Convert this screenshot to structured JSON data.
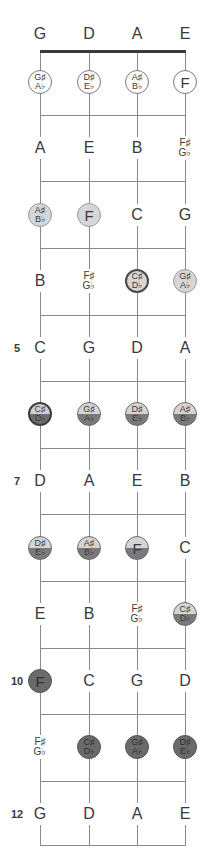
{
  "diagram": {
    "title_clipped": "",
    "strings": [
      "G",
      "D",
      "A",
      "E"
    ],
    "string_x": [
      40,
      89,
      137,
      185
    ],
    "nut_y": 51,
    "open_label_y": 34,
    "fret_lines_y": [
      115,
      181,
      248,
      315,
      381,
      448,
      514,
      581,
      648,
      714,
      781,
      845
    ],
    "fret_markers": [
      {
        "fret": 5,
        "label": "5"
      },
      {
        "fret": 7,
        "label": "7"
      },
      {
        "fret": 10,
        "label": "10"
      },
      {
        "fret": 12,
        "label": "12"
      }
    ],
    "colors": {
      "line": "#8a8a8a",
      "nut": "#3a3a3a",
      "light_fill": "#d6d6d6",
      "dark_fill": "#6a6a6a",
      "text": "#3a3a3a"
    },
    "frets": [
      {
        "fret": 1,
        "y": 82,
        "notes": [
          {
            "top": "G♯",
            "bottom": "A♭",
            "style": "outline"
          },
          {
            "top": "D♯",
            "bottom": "E♭",
            "style": "outline"
          },
          {
            "top": "A♯",
            "bottom": "B♭",
            "style": "outline"
          },
          {
            "text": "F",
            "style": "outline"
          }
        ]
      },
      {
        "fret": 2,
        "y": 148,
        "notes": [
          {
            "text": "A",
            "style": "plain"
          },
          {
            "text": "E",
            "style": "plain"
          },
          {
            "text": "B",
            "style": "plain"
          },
          {
            "top": "F♯",
            "bottom": "G♭",
            "style": "plain"
          }
        ]
      },
      {
        "fret": 3,
        "y": 215,
        "notes": [
          {
            "top": "A♯",
            "bottom": "B♭",
            "style": "light"
          },
          {
            "text": "F",
            "style": "light"
          },
          {
            "text": "C",
            "style": "plain"
          },
          {
            "text": "G",
            "style": "plain"
          }
        ]
      },
      {
        "fret": 4,
        "y": 281,
        "notes": [
          {
            "text": "B",
            "style": "plain"
          },
          {
            "top": "F♯",
            "bottom": "G♭",
            "style": "plain"
          },
          {
            "top": "C♯",
            "bottom": "D♭",
            "style": "ring"
          },
          {
            "top": "G♯",
            "bottom": "A♭",
            "style": "light"
          }
        ]
      },
      {
        "fret": 5,
        "y": 348,
        "notes": [
          {
            "text": "C",
            "style": "plain"
          },
          {
            "text": "G",
            "style": "plain"
          },
          {
            "text": "D",
            "style": "plain"
          },
          {
            "text": "A",
            "style": "plain"
          }
        ]
      },
      {
        "fret": 6,
        "y": 414,
        "notes": [
          {
            "top": "C♯",
            "bottom": "D♭",
            "style": "split-ring"
          },
          {
            "top": "G♯",
            "bottom": "A♭",
            "style": "split"
          },
          {
            "top": "D♯",
            "bottom": "E♭",
            "style": "split"
          },
          {
            "top": "A♯",
            "bottom": "B♭",
            "style": "split"
          }
        ]
      },
      {
        "fret": 7,
        "y": 481,
        "notes": [
          {
            "text": "D",
            "style": "plain"
          },
          {
            "text": "A",
            "style": "plain"
          },
          {
            "text": "E",
            "style": "plain"
          },
          {
            "text": "B",
            "style": "plain"
          }
        ]
      },
      {
        "fret": 8,
        "y": 548,
        "notes": [
          {
            "top": "D♯",
            "bottom": "E♭",
            "style": "split"
          },
          {
            "top": "A♯",
            "bottom": "B♭",
            "style": "split"
          },
          {
            "text": "F",
            "style": "split"
          },
          {
            "text": "C",
            "style": "plain"
          }
        ]
      },
      {
        "fret": 9,
        "y": 614,
        "notes": [
          {
            "text": "E",
            "style": "plain"
          },
          {
            "text": "B",
            "style": "plain"
          },
          {
            "top": "F♯",
            "bottom": "G♭",
            "style": "plain"
          },
          {
            "top": "C♯",
            "bottom": "D♭",
            "style": "split"
          }
        ]
      },
      {
        "fret": 10,
        "y": 681,
        "notes": [
          {
            "text": "F",
            "style": "dark"
          },
          {
            "text": "C",
            "style": "plain"
          },
          {
            "text": "G",
            "style": "plain"
          },
          {
            "text": "D",
            "style": "plain"
          }
        ]
      },
      {
        "fret": 11,
        "y": 747,
        "notes": [
          {
            "top": "F♯",
            "bottom": "G♭",
            "style": "plain"
          },
          {
            "top": "C♯",
            "bottom": "D♭",
            "style": "dark"
          },
          {
            "top": "G♯",
            "bottom": "A♭",
            "style": "dark"
          },
          {
            "top": "D♯",
            "bottom": "E♭",
            "style": "dark"
          }
        ]
      },
      {
        "fret": 12,
        "y": 814,
        "notes": [
          {
            "text": "G",
            "style": "plain"
          },
          {
            "text": "D",
            "style": "plain"
          },
          {
            "text": "A",
            "style": "plain"
          },
          {
            "text": "E",
            "style": "plain"
          }
        ]
      }
    ]
  }
}
